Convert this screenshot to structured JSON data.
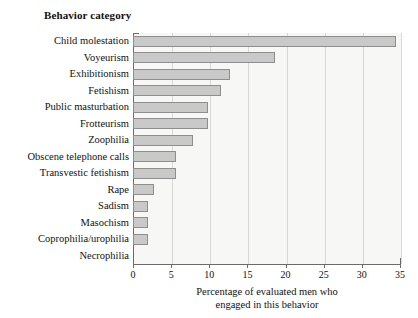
{
  "chart_data": {
    "type": "bar",
    "orientation": "horizontal",
    "title": "",
    "ylabel": "Behavior category",
    "xlabel": "Percentage of evaluated men who engaged in this behavior",
    "xlabel_lines": [
      "Percentage of evaluated men who",
      "engaged in this behavior"
    ],
    "categories": [
      "Child molestation",
      "Voyeurism",
      "Exhibitionism",
      "Fetishism",
      "Public masturbation",
      "Frotteurism",
      "Zoophilia",
      "Obscene telephone calls",
      "Transvestic fetishism",
      "Rape",
      "Sadism",
      "Masochism",
      "Coprophilia/urophilia",
      "Necrophilia"
    ],
    "values": [
      34.5,
      18.6,
      12.7,
      11.6,
      9.8,
      9.8,
      7.9,
      5.6,
      5.6,
      2.7,
      2.0,
      2.0,
      2.0,
      0.0
    ],
    "xlim": [
      0,
      35
    ],
    "xticks": [
      0,
      5,
      10,
      15,
      20,
      25,
      30,
      35
    ],
    "xtick_labels": [
      "0",
      "5",
      "10",
      "15",
      "20",
      "25",
      "30",
      "35"
    ],
    "grid": "vertical",
    "legend": "none",
    "bar_fill_color": "#c9c9c9",
    "bar_border_color": "#8e8e8e",
    "plot_background_color": "#f7f7f5",
    "axis_color": "#6b6b6b",
    "gridline_color": "#d8d8d4"
  }
}
